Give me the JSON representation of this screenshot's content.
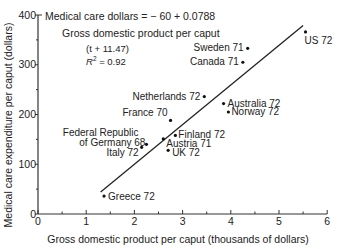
{
  "chart_data": {
    "type": "scatter",
    "title": "",
    "xlabel": "Gross domestic product per caput (thousands of dollars)",
    "ylabel": "Medical care expenditure per caput (dollars)",
    "xlim": [
      0,
      6
    ],
    "ylim": [
      0,
      400
    ],
    "x_ticks": [
      "0",
      "1",
      "2",
      "3",
      "4",
      "5",
      "6"
    ],
    "y_ticks": [
      "0",
      "100",
      "200",
      "300",
      "400"
    ],
    "grid": false,
    "points": [
      {
        "label": "US 72",
        "x": 5.55,
        "y": 366
      },
      {
        "label": "Sweden 71",
        "x": 4.35,
        "y": 333
      },
      {
        "label": "Canada 71",
        "x": 4.25,
        "y": 305
      },
      {
        "label": "Netherlands 72",
        "x": 3.45,
        "y": 236
      },
      {
        "label": "Australia 72",
        "x": 3.85,
        "y": 222
      },
      {
        "label": "Norway 72",
        "x": 3.95,
        "y": 205
      },
      {
        "label": "France 70",
        "x": 2.75,
        "y": 188
      },
      {
        "label": "Finland 72",
        "x": 2.85,
        "y": 158
      },
      {
        "label": "Austria 71",
        "x": 2.6,
        "y": 151
      },
      {
        "label": "UK 72",
        "x": 2.7,
        "y": 128
      },
      {
        "label": "Federal Republic of Germany 68",
        "x": 2.25,
        "y": 140
      },
      {
        "label": "Italy 72",
        "x": 2.15,
        "y": 134
      },
      {
        "label": "Greece 72",
        "x": 1.37,
        "y": 36
      }
    ],
    "regression_line": {
      "x": [
        1.3,
        5.5
      ],
      "y": [
        44,
        379
      ]
    },
    "annotations": [
      "Medical care dollars = − 60 + 0.0788",
      "Gross domestic product per caput",
      "(t + 11.47)",
      "R² = 0.92"
    ]
  },
  "equation": {
    "line1": "Medical care dollars = − 60 + 0.0788",
    "line2": "Gross domestic product per caput",
    "line3": "(t + 11.47)",
    "r2_prefix": "R",
    "r2_sup": "2",
    "r2_suffix": " = 0.92"
  }
}
